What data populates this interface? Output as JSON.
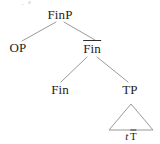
{
  "figure": {
    "kind": "syntax-tree",
    "notation": "X-bar",
    "line_color": "#8d8d8d",
    "text_color": "#232323",
    "background": "#ffffff"
  },
  "nodes": {
    "root": {
      "label": "FinP",
      "x": 60,
      "y": 14,
      "bar": false
    },
    "spec": {
      "label": "OP",
      "x": 18,
      "y": 47,
      "bar": false
    },
    "fin_bar": {
      "label": "Fin",
      "x": 92,
      "y": 48,
      "bar": true
    },
    "head": {
      "label": "Fin",
      "x": 60,
      "y": 89,
      "bar": false
    },
    "tp": {
      "label": "TP",
      "x": 130,
      "y": 89,
      "bar": false
    }
  },
  "triangle": {
    "apex_x": 131,
    "apex_y": 104,
    "base_y": 130,
    "base_left_x": 109,
    "base_right_x": 153
  },
  "leaf": {
    "trace": "t",
    "head": "T",
    "head_bar": true,
    "x": 131,
    "y": 136
  },
  "edges": [
    {
      "from": "root",
      "to": "spec",
      "x1": 56,
      "y1": 22,
      "x2": 22,
      "y2": 41
    },
    {
      "from": "root",
      "to": "fin_bar",
      "x1": 64,
      "y1": 22,
      "x2": 95,
      "y2": 40
    },
    {
      "from": "fin_bar",
      "to": "head",
      "x1": 87,
      "y1": 57,
      "x2": 61,
      "y2": 82
    },
    {
      "from": "fin_bar",
      "to": "tp",
      "x1": 97,
      "y1": 57,
      "x2": 128,
      "y2": 82
    }
  ]
}
